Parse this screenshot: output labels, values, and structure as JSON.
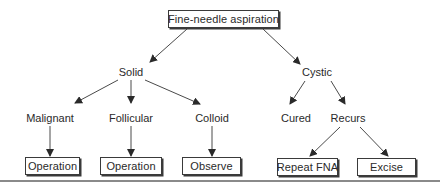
{
  "diagram": {
    "type": "decision-tree",
    "root": {
      "label": "Fine-needle aspiration"
    },
    "level1": [
      {
        "id": "solid",
        "label": "Solid"
      },
      {
        "id": "cystic",
        "label": "Cystic"
      }
    ],
    "level2": [
      {
        "id": "malignant",
        "label": "Malignant",
        "parent": "solid"
      },
      {
        "id": "follicular",
        "label": "Follicular",
        "parent": "solid"
      },
      {
        "id": "colloid",
        "label": "Colloid",
        "parent": "solid"
      },
      {
        "id": "cured",
        "label": "Cured",
        "parent": "cystic"
      },
      {
        "id": "recurs",
        "label": "Recurs",
        "parent": "cystic"
      }
    ],
    "outcomes": [
      {
        "id": "op1",
        "label": "Operation",
        "parent": "malignant"
      },
      {
        "id": "op2",
        "label": "Operation",
        "parent": "follicular"
      },
      {
        "id": "observe",
        "label": "Observe",
        "parent": "colloid"
      },
      {
        "id": "repeat",
        "label": "Repeat FNA",
        "parent": "recurs"
      },
      {
        "id": "excise",
        "label": "Excise",
        "parent": "recurs"
      }
    ],
    "colors": {
      "line": "#3a3a3a",
      "text": "#2a2a2a",
      "rule": "#8a8a8a",
      "background": "#ffffff"
    }
  }
}
